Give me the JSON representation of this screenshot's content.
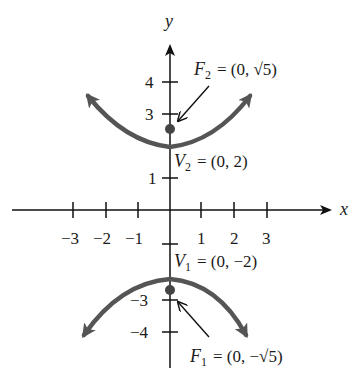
{
  "figure": {
    "type": "hyperbola-graph",
    "equation_implied": "y^2/4 - x^2 = 1",
    "axes": {
      "x_label": "x",
      "y_label": "y",
      "x_ticks": [
        -3,
        -2,
        -1,
        1,
        2,
        3
      ],
      "x_tick_labels": [
        "−3",
        "−2",
        "−1",
        "1",
        "2",
        "3"
      ],
      "y_ticks": [
        4,
        3,
        1,
        -1,
        -3,
        -4
      ],
      "y_tick_labels": [
        "4",
        "3",
        "1",
        "",
        "−3",
        "−4"
      ]
    },
    "points": {
      "F2": {
        "name": "F",
        "sub": "2",
        "text": "= (0, √5)",
        "x": 0,
        "y": 2.236
      },
      "V2": {
        "name": "V",
        "sub": "2",
        "text": "= (0, 2)",
        "x": 0,
        "y": 2
      },
      "V1": {
        "name": "V",
        "sub": "1",
        "text": "= (0, −2)",
        "x": 0,
        "y": -2
      },
      "F1": {
        "name": "F",
        "sub": "1",
        "text": "= (0, −√5)",
        "x": 0,
        "y": -2.236
      }
    },
    "colors": {
      "axis": "#111111",
      "curve": "#555555",
      "text": "#1a1a1a"
    }
  }
}
